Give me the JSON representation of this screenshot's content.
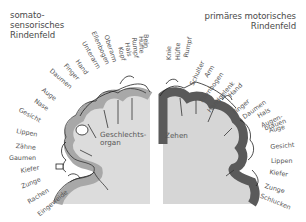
{
  "diagram": {
    "left_panel": {
      "title_lines": [
        "somato-",
        "sensorisches",
        "Rindenfeld"
      ],
      "labels": [
        "Bein",
        "Hüfte",
        "Rumpf",
        "Hals",
        "Kopf",
        "Oberarm",
        "Ellenbogen",
        "Unterarm",
        "Hand",
        "Finger",
        "Daumen",
        "Auge",
        "Nase",
        "Gesicht",
        "Lippen",
        "Zähne",
        "Gaumen",
        "Kiefer",
        "Zunge",
        "Rachen",
        "Eingeweide"
      ],
      "inner_label": [
        "Geschlechts-",
        "organ"
      ]
    },
    "right_panel": {
      "title_lines": [
        "primäres motorisches",
        "Rindenfeld"
      ],
      "labels": [
        "Knie",
        "Hüfte",
        "Rumpf",
        "Schulter",
        "Arm",
        "Ellenbogen",
        "Handgelenk",
        "Hand",
        "Finger",
        "Daumen",
        "Hals",
        "Augen-",
        "brauen",
        "Auge",
        "Gesicht",
        "Lippen",
        "Kiefer",
        "Zunge",
        "Schlucken"
      ],
      "inner_label": "Zehen"
    },
    "colors": {
      "background": "#ffffff",
      "brain_fill": "#d6d6d6",
      "sensory_cortex": "#a8a8a8",
      "motor_cortex": "#5a5a5a",
      "text": "#555555"
    }
  }
}
